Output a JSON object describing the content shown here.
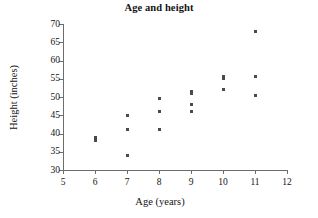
{
  "chart_data": {
    "type": "scatter",
    "title": "Age and height",
    "xlabel": "Age (years)",
    "ylabel": "Height (inches)",
    "xlim": [
      5,
      12
    ],
    "ylim": [
      30,
      70
    ],
    "xticks": [
      5,
      6,
      7,
      8,
      9,
      10,
      11,
      12
    ],
    "yticks": [
      30,
      35,
      40,
      45,
      50,
      55,
      60,
      65,
      70
    ],
    "xtick_labels": [
      "5",
      "6",
      "7",
      "8",
      "9",
      "10",
      "11",
      "12"
    ],
    "ytick_labels": [
      "30",
      "35",
      "40",
      "45",
      "50",
      "55",
      "60",
      "65",
      "70"
    ],
    "grid": false,
    "legend": false,
    "marker": "square",
    "marker_color": "#4a4a4a",
    "points": [
      {
        "x": 6,
        "y": 39
      },
      {
        "x": 6,
        "y": 38
      },
      {
        "x": 7,
        "y": 45
      },
      {
        "x": 7,
        "y": 41
      },
      {
        "x": 7,
        "y": 34
      },
      {
        "x": 8,
        "y": 49.5
      },
      {
        "x": 8,
        "y": 46
      },
      {
        "x": 8,
        "y": 41
      },
      {
        "x": 9,
        "y": 51.5
      },
      {
        "x": 9,
        "y": 51
      },
      {
        "x": 9,
        "y": 48
      },
      {
        "x": 9,
        "y": 46
      },
      {
        "x": 10,
        "y": 55.5
      },
      {
        "x": 10,
        "y": 55
      },
      {
        "x": 10,
        "y": 52
      },
      {
        "x": 11,
        "y": 68
      },
      {
        "x": 11,
        "y": 55.5
      },
      {
        "x": 11,
        "y": 50.5
      }
    ],
    "x": [
      6,
      6,
      7,
      7,
      7,
      8,
      8,
      8,
      9,
      9,
      9,
      9,
      10,
      10,
      10,
      11,
      11,
      11
    ],
    "values": [
      39,
      38,
      45,
      41,
      34,
      49.5,
      46,
      41,
      51.5,
      51,
      48,
      46,
      55.5,
      55,
      52,
      68,
      55.5,
      50.5
    ]
  }
}
